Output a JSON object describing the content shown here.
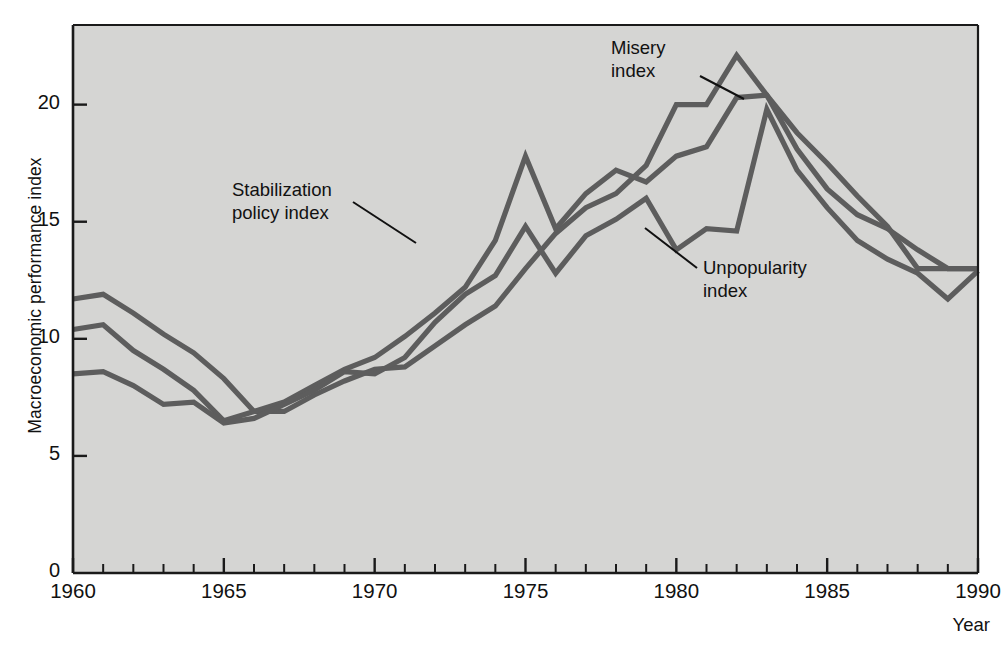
{
  "chart_data": {
    "type": "line",
    "title": "",
    "subtitle": "",
    "xlabel": "Year",
    "ylabel": "Macroeconomic performance index",
    "xlim": [
      1960,
      1990
    ],
    "ylim": [
      0,
      23.4
    ],
    "grid": false,
    "legend_position": "inline-annotations",
    "background_color": "#d5d5d3",
    "line_color": "#5d5d5d",
    "axis_color": "#1a1a1a",
    "x_tick_labels": [
      "1960",
      "1965",
      "1970",
      "1975",
      "1980",
      "1985",
      "1990"
    ],
    "x_tick_values": [
      1960,
      1965,
      1970,
      1975,
      1980,
      1985,
      1990
    ],
    "x_minor_tick_interval": 1,
    "y_tick_labels": [
      "0",
      "5",
      "10",
      "15",
      "20"
    ],
    "y_tick_values": [
      0,
      5,
      10,
      15,
      20
    ],
    "x": [
      1960,
      1961,
      1962,
      1963,
      1964,
      1965,
      1966,
      1967,
      1968,
      1969,
      1970,
      1971,
      1972,
      1973,
      1974,
      1975,
      1976,
      1977,
      1978,
      1979,
      1980,
      1981,
      1982,
      1983,
      1984,
      1985,
      1986,
      1987,
      1988,
      1989,
      1990
    ],
    "series": [
      {
        "name": "Misery index",
        "values": [
          11.7,
          11.9,
          11.1,
          10.2,
          9.4,
          8.3,
          6.9,
          6.9,
          7.6,
          8.2,
          8.7,
          8.8,
          9.7,
          10.6,
          11.4,
          13.0,
          14.5,
          15.6,
          16.2,
          17.4,
          20.0,
          20.0,
          22.1,
          20.4,
          18.1,
          16.4,
          15.3,
          14.7,
          13.8,
          13.0,
          13.0
        ]
      },
      {
        "name": "Stabilization policy index",
        "values": [
          10.4,
          10.6,
          9.5,
          8.7,
          7.8,
          6.5,
          6.9,
          7.3,
          8.0,
          8.7,
          9.2,
          10.1,
          11.1,
          12.2,
          14.2,
          17.8,
          14.7,
          16.2,
          17.2,
          16.7,
          17.8,
          18.2,
          20.3,
          20.4,
          18.8,
          17.5,
          16.1,
          14.8,
          13.0,
          13.0,
          13.0
        ]
      },
      {
        "name": "Unpopularity index",
        "values": [
          8.5,
          8.6,
          8.0,
          7.2,
          7.3,
          6.4,
          6.6,
          7.2,
          7.8,
          8.6,
          8.5,
          9.2,
          10.7,
          11.9,
          12.7,
          14.8,
          12.8,
          14.4,
          15.1,
          16.0,
          13.8,
          14.7,
          14.6,
          19.8,
          17.2,
          15.6,
          14.2,
          13.4,
          12.8,
          11.7,
          12.9
        ]
      }
    ],
    "annotations": [
      {
        "id": "misery-index-label",
        "text": "Misery\nindex",
        "x_px": 611,
        "y_px": 37
      },
      {
        "id": "stabilization-policy-index-label",
        "text": "Stabilization\npolicy index",
        "x_px": 232,
        "y_px": 179
      },
      {
        "id": "unpopularity-index-label",
        "text": "Unpopularity\nindex",
        "x_px": 703,
        "y_px": 257
      }
    ]
  }
}
